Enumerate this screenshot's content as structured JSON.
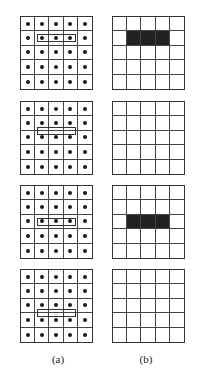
{
  "figure": {
    "grid_size": 5,
    "panels": [
      {
        "sample_row": 2,
        "offset": "centered",
        "window_cols": [
          2,
          4
        ],
        "output_filled_row": 2,
        "output_filled_cols": [
          2,
          4
        ]
      },
      {
        "sample_row": 2,
        "offset": "between-rows-2-3",
        "window_cols": [
          2,
          4
        ],
        "output_filled_row": null,
        "output_filled_cols": null
      },
      {
        "sample_row": 3,
        "offset": "centered",
        "window_cols": [
          2,
          4
        ],
        "output_filled_row": 3,
        "output_filled_cols": [
          2,
          4
        ]
      },
      {
        "sample_row": 3,
        "offset": "between-rows-3-4",
        "window_cols": [
          2,
          4
        ],
        "output_filled_row": null,
        "output_filled_cols": null
      }
    ],
    "labels": {
      "a": "(a)",
      "b": "(b)"
    },
    "colors": {
      "line": "#333333",
      "dot": "#1a1a1a",
      "fill": "#222222"
    }
  }
}
